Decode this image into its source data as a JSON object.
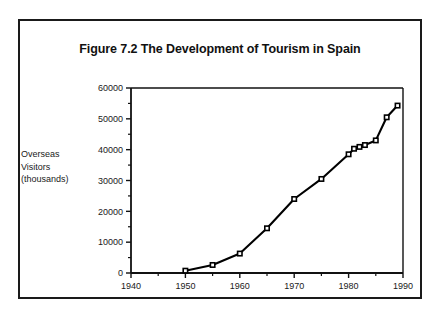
{
  "figure": {
    "title": "Figure 7.2 The Development of Tourism in Spain",
    "axis_label_lines": [
      "Overseas",
      "Visitors",
      "(thousands)"
    ]
  },
  "chart_data": {
    "type": "line",
    "title": "Figure 7.2 The Development of Tourism in Spain",
    "xlabel": "",
    "ylabel": "Overseas Visitors (thousands)",
    "xlim": [
      1940,
      1990
    ],
    "ylim": [
      0,
      60000
    ],
    "xticks": [
      1940,
      1950,
      1960,
      1970,
      1980,
      1990
    ],
    "xtick_labels": [
      "1940",
      "1950",
      "1960",
      "1970",
      "1980",
      "1990"
    ],
    "xminor_ticks": [
      1945,
      1955,
      1965,
      1975,
      1985
    ],
    "yticks": [
      0,
      10000,
      20000,
      30000,
      40000,
      50000,
      60000
    ],
    "ytick_labels": [
      "0",
      "10000",
      "20000",
      "30000",
      "40000",
      "50000",
      "60000"
    ],
    "yminor_ticks": [
      5000,
      15000,
      25000,
      35000,
      45000,
      55000
    ],
    "grid": false,
    "legend": false,
    "marker": "square",
    "line_color": "#000000",
    "x": [
      1950,
      1955,
      1960,
      1965,
      1970,
      1975,
      1980,
      1981,
      1982,
      1983,
      1985,
      1987,
      1989
    ],
    "values": [
      750,
      2600,
      6300,
      14500,
      24000,
      30500,
      38500,
      40300,
      40900,
      41500,
      43000,
      50500,
      54300
    ],
    "series": [
      {
        "name": "Overseas Visitors (thousands)",
        "points": [
          {
            "x": 1950,
            "y": 750
          },
          {
            "x": 1955,
            "y": 2600
          },
          {
            "x": 1960,
            "y": 6300
          },
          {
            "x": 1965,
            "y": 14500
          },
          {
            "x": 1970,
            "y": 24000
          },
          {
            "x": 1975,
            "y": 30500
          },
          {
            "x": 1980,
            "y": 38500
          },
          {
            "x": 1981,
            "y": 40300
          },
          {
            "x": 1982,
            "y": 40900
          },
          {
            "x": 1983,
            "y": 41500
          },
          {
            "x": 1985,
            "y": 43000
          },
          {
            "x": 1987,
            "y": 50500
          },
          {
            "x": 1989,
            "y": 54300
          }
        ]
      }
    ]
  }
}
